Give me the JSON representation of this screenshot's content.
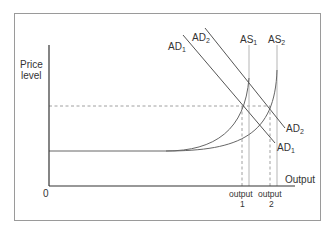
{
  "diagram": {
    "type": "aggregate-demand-aggregate-supply",
    "y_axis_label_line1": "Price",
    "y_axis_label_line2": "level",
    "x_axis_label": "Output",
    "origin_label": "0",
    "curves": {
      "ad1_top": "AD",
      "ad1_top_sub": "1",
      "ad2_top": "AD",
      "ad2_top_sub": "2",
      "as1": "AS",
      "as1_sub": "1",
      "as2": "AS",
      "as2_sub": "2",
      "ad2_bottom": "AD",
      "ad2_bottom_sub": "2",
      "ad1_bottom": "AD",
      "ad1_bottom_sub": "1"
    },
    "x_ticks": [
      {
        "line1": "output",
        "line2": "1"
      },
      {
        "line1": "output",
        "line2": "2"
      }
    ],
    "colors": {
      "axis": "#333333",
      "curve": "#666666",
      "vertical_as": "#b5b5b5",
      "dashed": "#888888",
      "frame": "#9a9a9a"
    }
  }
}
